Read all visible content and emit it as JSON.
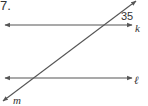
{
  "problem": {
    "number": "7."
  },
  "diagram": {
    "lines": {
      "k": {
        "label": "k"
      },
      "l": {
        "label": "ℓ"
      },
      "m": {
        "label": "m"
      }
    },
    "angle": {
      "value": "35"
    },
    "colors": {
      "line": "#555555",
      "text": "#333333",
      "background": "#ffffff"
    }
  }
}
